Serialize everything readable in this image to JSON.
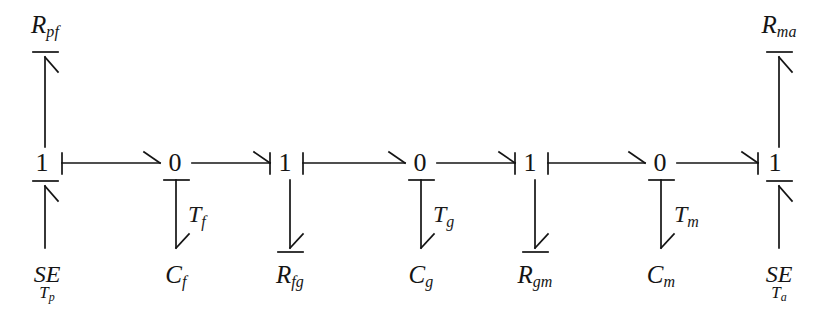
{
  "figure": {
    "type": "bond-graph",
    "ink_color": "#141414",
    "background_color": "#ffffff",
    "row_y": 163,
    "junctions": [
      {
        "id": "j1",
        "label": "1",
        "x": 42,
        "y": 163
      },
      {
        "id": "j2",
        "label": "0",
        "x": 175,
        "y": 163
      },
      {
        "id": "j3",
        "label": "1",
        "x": 285,
        "y": 163
      },
      {
        "id": "j4",
        "label": "0",
        "x": 420,
        "y": 163
      },
      {
        "id": "j5",
        "label": "1",
        "x": 530,
        "y": 163
      },
      {
        "id": "j6",
        "label": "0",
        "x": 660,
        "y": 163
      },
      {
        "id": "j7",
        "label": "1",
        "x": 775,
        "y": 163
      }
    ],
    "top_elements": [
      {
        "id": "rpf",
        "base": "R",
        "sub": "pf",
        "x": 45,
        "y": 12,
        "junction": "j1"
      },
      {
        "id": "rma",
        "base": "R",
        "sub": "ma",
        "x": 779,
        "y": 12,
        "junction": "j7"
      }
    ],
    "bottom_elements": [
      {
        "id": "se_tp",
        "base": "SE",
        "sub": "T",
        "sub2": "p",
        "x": 47,
        "y": 262,
        "junction": "j1",
        "kind": "source"
      },
      {
        "id": "cf",
        "base": "C",
        "sub": "f",
        "x": 176,
        "y": 262,
        "junction": "j2",
        "kind": "storage"
      },
      {
        "id": "rfg",
        "base": "R",
        "sub": "fg",
        "x": 290,
        "y": 262,
        "junction": "j3",
        "kind": "resistor"
      },
      {
        "id": "cg",
        "base": "C",
        "sub": "g",
        "x": 421,
        "y": 262,
        "junction": "j4",
        "kind": "storage"
      },
      {
        "id": "rgm",
        "base": "R",
        "sub": "gm",
        "x": 535,
        "y": 262,
        "junction": "j5",
        "kind": "resistor"
      },
      {
        "id": "cm",
        "base": "C",
        "sub": "m",
        "x": 661,
        "y": 262,
        "junction": "j6",
        "kind": "storage"
      },
      {
        "id": "se_ta",
        "base": "SE",
        "sub": "T",
        "sub2": "a",
        "x": 779,
        "y": 262,
        "junction": "j7",
        "kind": "source"
      }
    ],
    "bond_labels": [
      {
        "id": "tf",
        "base": "T",
        "sub": "f",
        "x": 188,
        "y": 216
      },
      {
        "id": "tg",
        "base": "T",
        "sub": "g",
        "x": 433,
        "y": 216
      },
      {
        "id": "tm",
        "base": "T",
        "sub": "m",
        "x": 674,
        "y": 216
      }
    ]
  }
}
